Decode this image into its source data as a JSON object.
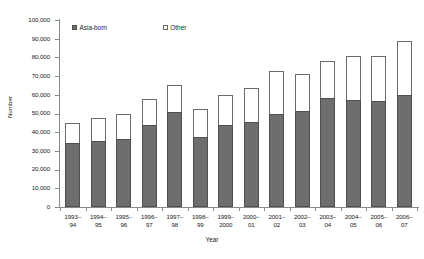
{
  "chart_data": {
    "type": "bar",
    "subtype": "stacked-vertical",
    "title": "",
    "xlabel": "Year",
    "ylabel": "Number",
    "ylim": [
      0,
      100000
    ],
    "ytick_step": 10000,
    "ytick_labels": [
      "100,000",
      "90,000",
      "80,000",
      "70,000",
      "60,000",
      "50,000",
      "40,000",
      "30,000",
      "20,000",
      "10,000",
      "0"
    ],
    "grid": false,
    "legend_position": "top-inside",
    "categories": [
      "1993–\n94",
      "1994–\n95",
      "1995–\n96",
      "1996–\n97",
      "1997–\n98",
      "1998–\n99",
      "1999–\n2000",
      "2000–\n01",
      "2001–\n02",
      "2002–\n03",
      "2003–\n04",
      "2004–\n05",
      "2005–\n06",
      "2006–\n07"
    ],
    "series": [
      {
        "name": "Asia-born",
        "color": "#6e6e6e",
        "values": [
          34000,
          35500,
          36500,
          44000,
          51000,
          37500,
          44000,
          45500,
          50000,
          51500,
          58500,
          57000,
          56500,
          60000
        ]
      },
      {
        "name": "Other",
        "color": "#ffffff",
        "values": [
          11000,
          12000,
          13500,
          14000,
          14500,
          15000,
          16000,
          18000,
          22500,
          19500,
          19500,
          23500,
          24000,
          29000
        ]
      }
    ],
    "totals": [
      45000,
      47500,
      50000,
      58000,
      65500,
      52500,
      60000,
      63500,
      72500,
      71000,
      78000,
      80500,
      80500,
      89000
    ]
  },
  "legend": {
    "items": [
      {
        "label": "Asia-born",
        "swatch": "filled-gray-square"
      },
      {
        "label": "Other",
        "swatch": "open-white-square"
      }
    ]
  },
  "axes": {
    "y_title": "Number",
    "x_title": "Year"
  }
}
